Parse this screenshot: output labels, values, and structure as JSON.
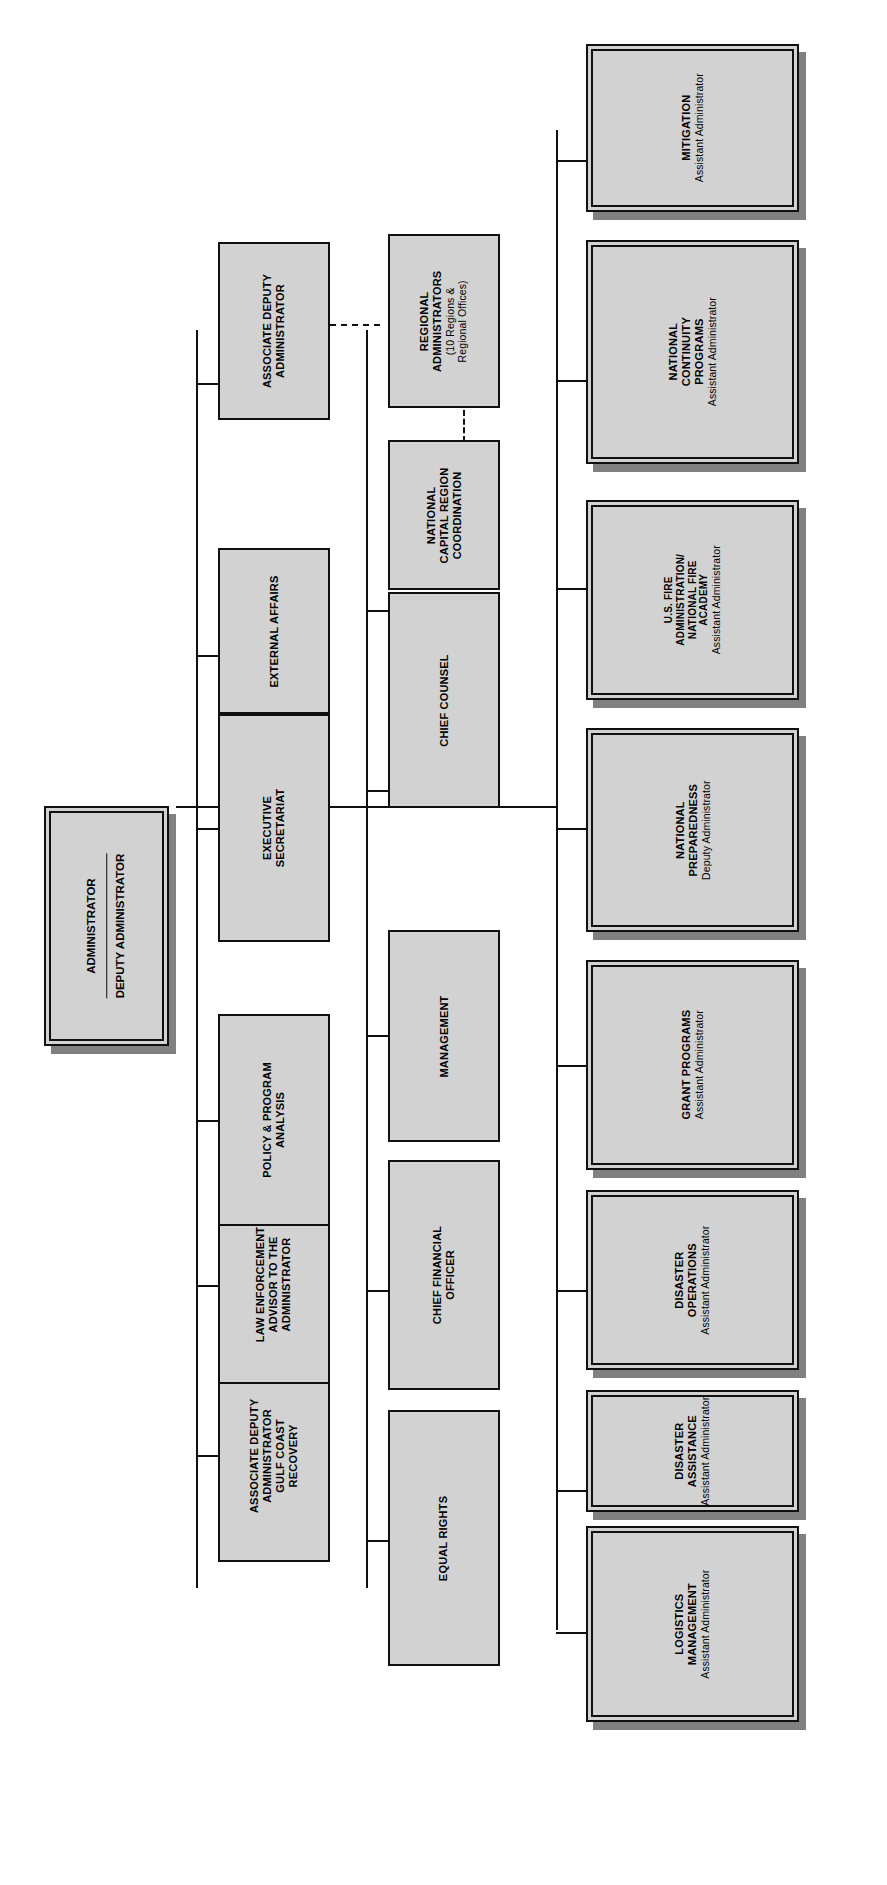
{
  "chart": {
    "type": "org-chart",
    "orientation": "rotated-90-ccw",
    "head": {
      "line1": "ADMINISTRATOR",
      "line2": "DEPUTY ADMINISTRATOR"
    },
    "row_staff_upper": [
      {
        "title": "ASSOCIATE DEPUTY\nADMINISTRATOR\nGULF COAST\nRECOVERY"
      },
      {
        "title": "LAW ENFORCEMENT\nADVISOR TO THE\nADMINISTRATOR"
      },
      {
        "title": "POLICY & PROGRAM\nANALYSIS"
      },
      {
        "title": "EXECUTIVE\nSECRETARIAT"
      },
      {
        "title": "EXTERNAL AFFAIRS"
      },
      {
        "title": "ASSOCIATE DEPUTY\nADMINISTRATOR"
      }
    ],
    "row_staff_lower": [
      {
        "title": "EQUAL RIGHTS"
      },
      {
        "title": "CHIEF FINANCIAL\nOFFICER"
      },
      {
        "title": "MANAGEMENT"
      },
      {
        "title": "CHIEF COUNSEL"
      },
      {
        "title": "NATIONAL\nCAPITAL REGION\nCOORDINATION"
      },
      {
        "title": "REGIONAL\nADMINISTRATORS",
        "note": "(10 Regions &\nRegional Offices)"
      }
    ],
    "row_programs": [
      {
        "title": "LOGISTICS\nMANAGEMENT",
        "subtitle": "Assistant Administrator"
      },
      {
        "title": "DISASTER\nASSISTANCE",
        "subtitle": "Assistant Administrator"
      },
      {
        "title": "DISASTER\nOPERATIONS",
        "subtitle": "Assistant Administrator"
      },
      {
        "title": "GRANT PROGRAMS",
        "subtitle": "Assistant Administrator"
      },
      {
        "title": "NATIONAL\nPREPAREDNESS",
        "subtitle": "Deputy Administrator"
      },
      {
        "title": "U.S. FIRE\nADMINISTRATION/\nNATIONAL FIRE\nACADEMY",
        "subtitle": "Assistant Administrator"
      },
      {
        "title": "NATIONAL\nCONTINUITY\nPROGRAMS",
        "subtitle": "Assistant Administrator"
      },
      {
        "title": "MITIGATION",
        "subtitle": "Assistant Administrator"
      }
    ],
    "colors": {
      "box_fill": "#d2d2d2",
      "border": "#101010",
      "shadow": "#808080",
      "background": "#ffffff"
    }
  }
}
